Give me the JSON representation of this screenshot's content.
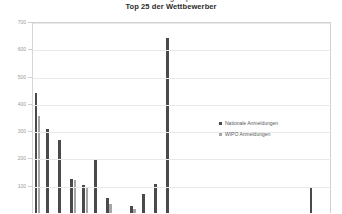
{
  "titles": {
    "clipped_above": "Anzahl der Anmeldungen pro Wettbewerber",
    "main": "Top 25 der Wettbewerber"
  },
  "legend": {
    "position": "inside-right",
    "entries": [
      {
        "label": "Nationale Anmeldungen",
        "color": "#4a4a4a"
      },
      {
        "label": "WIPO Anmeldungen",
        "color": "#a6a6a6"
      }
    ]
  },
  "axis": {
    "y_ticks": [
      "700",
      "600",
      "500",
      "400",
      "300",
      "200",
      "100"
    ],
    "y_min": 0,
    "y_max": 700
  },
  "chart_data": {
    "type": "bar",
    "title": "Top 25 der Wettbewerber",
    "xlabel": "",
    "ylabel": "",
    "ylim": [
      0,
      700
    ],
    "grid": true,
    "legend_position": "inside-right",
    "categories": [
      "1",
      "2",
      "3",
      "4",
      "5",
      "6",
      "7",
      "8",
      "9",
      "10",
      "11",
      "12",
      "13",
      "14",
      "15",
      "16",
      "17",
      "18",
      "19",
      "20",
      "21",
      "22",
      "23",
      "24",
      "25"
    ],
    "series": [
      {
        "name": "Nationale Anmeldungen",
        "color": "#4a4a4a",
        "values": [
          442,
          312,
          270,
          130,
          105,
          200,
          60,
          0,
          30,
          75,
          110,
          645,
          0,
          0,
          0,
          0,
          0,
          0,
          0,
          0,
          0,
          0,
          0,
          95,
          0
        ]
      },
      {
        "name": "WIPO Anmeldungen",
        "color": "#a6a6a6",
        "values": [
          360,
          0,
          0,
          125,
          100,
          0,
          35,
          0,
          18,
          0,
          0,
          0,
          0,
          0,
          0,
          0,
          0,
          0,
          0,
          0,
          0,
          0,
          0,
          0,
          0
        ]
      }
    ]
  }
}
